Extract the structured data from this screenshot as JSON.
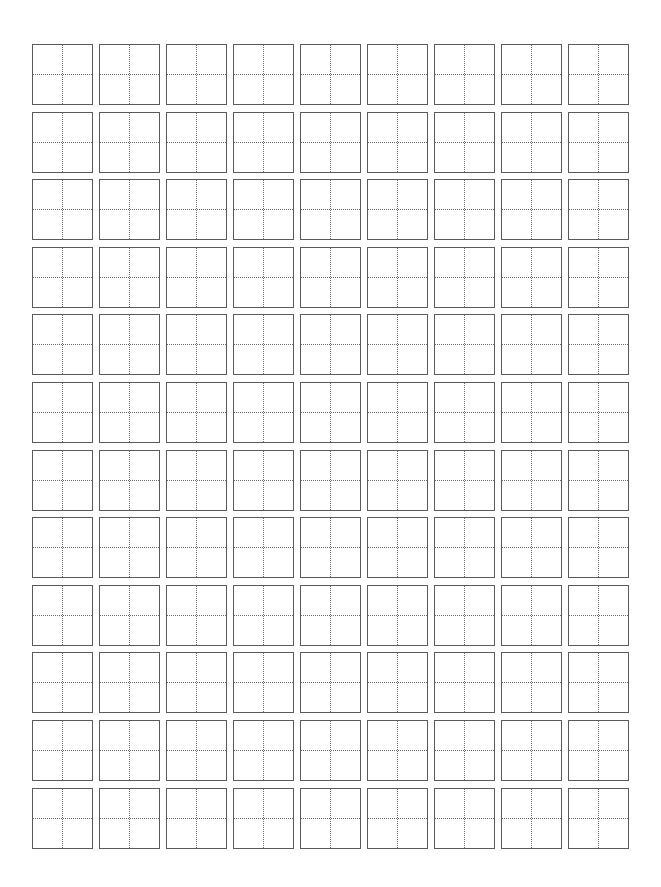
{
  "page": {
    "title": "",
    "type": "tianzige-practice-grid",
    "background_color": "#ffffff"
  },
  "grid": {
    "columns": 9,
    "rows": 12,
    "origin_x": 32,
    "origin_y": 44,
    "col_pitch": 67,
    "row_pitch": 67.6,
    "cell_size": 60,
    "border_color": "#5a5a5a",
    "guide_color": "#6a6a6a",
    "guide_style": "dotted",
    "guides": [
      "vertical-center",
      "horizontal-center"
    ],
    "cells_content": []
  }
}
